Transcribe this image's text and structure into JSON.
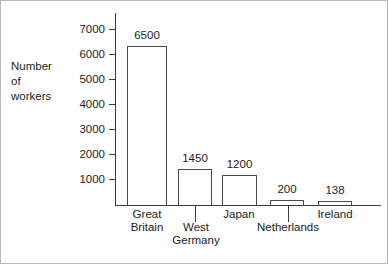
{
  "chart_data": {
    "type": "bar",
    "title": "",
    "subtitle": "",
    "xlabel": "",
    "ylabel": "Number of workers",
    "ylabel_lines": [
      "Number",
      "of",
      "workers"
    ],
    "categories": [
      "Great Britain",
      "West Germany",
      "Japan",
      "Netherlands",
      "Ireland"
    ],
    "category_lines": [
      [
        "Great",
        "Britain"
      ],
      [
        "West",
        "Germany"
      ],
      [
        "Japan"
      ],
      [
        "Netherlands"
      ],
      [
        "Ireland"
      ]
    ],
    "values": [
      6500,
      1450,
      1200,
      200,
      138
    ],
    "value_labels": [
      "6500",
      "1450",
      "1200",
      "200",
      "138"
    ],
    "ylim": [
      0,
      7400
    ],
    "ytick_values": [
      1000,
      2000,
      3000,
      4000,
      5000,
      6000,
      7000
    ],
    "ytick_labels": [
      "7000",
      "6000",
      "5000",
      "4000",
      "3000",
      "2000",
      "1000"
    ],
    "grid": false,
    "legend": null,
    "bar_fill": "#ffffff",
    "bar_stroke": "#4a4a4a",
    "axis_color": "#3b3b3b",
    "text_color": "#1d1d1d",
    "background": "#ffffff"
  },
  "geometry": {
    "y_ticks_px": [
      {
        "label": "7000",
        "top": 28
      },
      {
        "label": "6000",
        "top": 53
      },
      {
        "label": "5000",
        "top": 78
      },
      {
        "label": "4000",
        "top": 103
      },
      {
        "label": "3000",
        "top": 128
      },
      {
        "label": "2000",
        "top": 153
      },
      {
        "label": "1000",
        "top": 178
      }
    ],
    "bars_px": [
      {
        "label": "6500",
        "left": 126,
        "width": 40,
        "top": 45
      },
      {
        "label": "1450",
        "left": 177,
        "width": 34,
        "top": 168
      },
      {
        "label": "1200",
        "left": 221,
        "width": 35,
        "top": 174
      },
      {
        "label": "200",
        "left": 269,
        "width": 34,
        "top": 199
      },
      {
        "label": "138",
        "left": 317,
        "width": 34,
        "top": 200
      }
    ],
    "cat_labels_px": [
      {
        "left": 112,
        "top": 207,
        "width": 68,
        "lines": [
          "Great",
          "Britain"
        ]
      },
      {
        "left": 161,
        "top": 220,
        "width": 68,
        "lines": [
          "West",
          "Germany"
        ]
      },
      {
        "left": 204,
        "top": 207,
        "width": 68,
        "lines": [
          "Japan"
        ]
      },
      {
        "left": 245,
        "top": 220,
        "width": 84,
        "lines": [
          "Netherlands"
        ]
      },
      {
        "left": 300,
        "top": 207,
        "width": 68,
        "lines": [
          "Ireland"
        ]
      }
    ],
    "cat_dividers_px": [
      {
        "left": 194,
        "top": 205,
        "height": 16
      },
      {
        "left": 287,
        "top": 205,
        "height": 16
      }
    ]
  }
}
